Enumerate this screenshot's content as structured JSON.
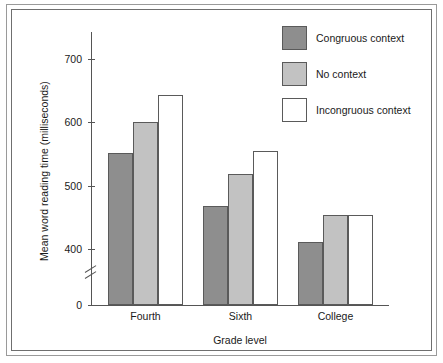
{
  "figure": {
    "background": "#ffffff",
    "frame_color": "#6f6f6f"
  },
  "chart_data": {
    "type": "bar",
    "title": "",
    "xlabel": "Grade level",
    "ylabel": "Mean word reading time (milliseconds)",
    "categories": [
      "Fourth",
      "Sixth",
      "College"
    ],
    "series": [
      {
        "name": "Congruous context",
        "color": "#8e8e8e",
        "values": [
          551,
          467,
          411
        ]
      },
      {
        "name": "No context",
        "color": "#c2c2c2",
        "values": [
          600,
          518,
          453
        ]
      },
      {
        "name": "Incongruous context",
        "color": "#ffffff",
        "values": [
          643,
          555,
          453
        ]
      }
    ],
    "ylim": [
      0,
      740
    ],
    "yticks": [
      400,
      500,
      600,
      700
    ],
    "ytick_labels": [
      "400",
      "500",
      "600",
      "700"
    ],
    "y_zero_label": "0",
    "axis_break": true,
    "axis_break_between": [
      0,
      400
    ],
    "grid": false,
    "legend_position": "top-right"
  },
  "axis": {
    "y_title": "Mean word reading time (milliseconds)",
    "x_title": "Grade level",
    "zero": "0",
    "ticks": [
      "700",
      "600",
      "500",
      "400"
    ]
  },
  "categories": [
    {
      "label": "Fourth"
    },
    {
      "label": "Sixth"
    },
    {
      "label": "College"
    }
  ],
  "legend": {
    "items": [
      {
        "label": "Congruous context"
      },
      {
        "label": "No context"
      },
      {
        "label": "Incongruous context"
      }
    ]
  }
}
